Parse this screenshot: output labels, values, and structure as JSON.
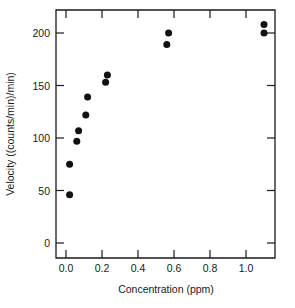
{
  "chart_data": {
    "type": "scatter",
    "title": "",
    "subtitle": "",
    "xlabel": "Concentration (ppm)",
    "ylabel": "Velocity ((counts/min)/min)",
    "xlim": [
      -0.045,
      1.165
    ],
    "ylim": [
      -18,
      222
    ],
    "grid": false,
    "legend": null,
    "legend_position": "none",
    "marker_style": "filled-circle",
    "marker_color": "#111111",
    "frame": "box",
    "tick_direction": "in",
    "xticks": [
      0.0,
      0.2,
      0.4,
      0.6,
      0.8,
      1.0
    ],
    "xticklabels": [
      "0.0",
      "0.2",
      "0.4",
      "0.6",
      "0.8",
      "1.0"
    ],
    "yticks": [
      0,
      50,
      100,
      150,
      200
    ],
    "yticklabels": [
      "0",
      "50",
      "100",
      "150",
      "200"
    ],
    "series": [
      {
        "name": "observations",
        "x": [
          0.02,
          0.02,
          0.06,
          0.07,
          0.11,
          0.12,
          0.22,
          0.23,
          0.56,
          0.57,
          1.1,
          1.1
        ],
        "y": [
          46,
          75,
          97,
          107,
          122,
          139,
          153,
          160,
          189,
          200,
          200,
          208
        ]
      }
    ],
    "points": [
      {
        "x": 0.02,
        "y": 46
      },
      {
        "x": 0.02,
        "y": 75
      },
      {
        "x": 0.06,
        "y": 97
      },
      {
        "x": 0.07,
        "y": 107
      },
      {
        "x": 0.11,
        "y": 122
      },
      {
        "x": 0.12,
        "y": 139
      },
      {
        "x": 0.22,
        "y": 153
      },
      {
        "x": 0.23,
        "y": 160
      },
      {
        "x": 0.56,
        "y": 189
      },
      {
        "x": 0.57,
        "y": 200
      },
      {
        "x": 1.1,
        "y": 200
      },
      {
        "x": 1.1,
        "y": 208
      }
    ],
    "annotations": []
  },
  "axes": {
    "x_label": "Concentration (ppm)",
    "y_label": "Velocity ((counts/min)/min)",
    "x_ticks": [
      {
        "value": 0.0,
        "label": "0.0"
      },
      {
        "value": 0.2,
        "label": "0.2"
      },
      {
        "value": 0.4,
        "label": "0.4"
      },
      {
        "value": 0.6,
        "label": "0.6"
      },
      {
        "value": 0.8,
        "label": "0.8"
      },
      {
        "value": 1.0,
        "label": "1.0"
      }
    ],
    "y_ticks": [
      {
        "value": 0,
        "label": "0"
      },
      {
        "value": 50,
        "label": "50"
      },
      {
        "value": 100,
        "label": "100"
      },
      {
        "value": 150,
        "label": "150"
      },
      {
        "value": 200,
        "label": "200"
      }
    ]
  },
  "colors": {
    "marker": "#111111",
    "axis": "#1a1a1a",
    "background": "#ffffff"
  }
}
